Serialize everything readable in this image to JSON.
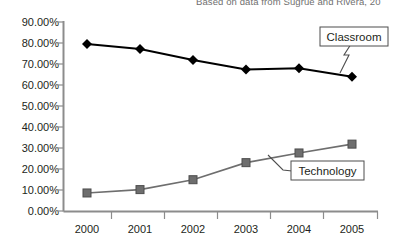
{
  "source_note": "Based on data from Sugrue and Rivera, 20",
  "chart_data": {
    "type": "line",
    "title": "",
    "subtitle": "",
    "xlabel": "",
    "ylabel": "",
    "categories": [
      "2000",
      "2001",
      "2002",
      "2003",
      "2004",
      "2005"
    ],
    "ytick_labels": [
      "0.00%",
      "10.00%",
      "20.00%",
      "30.00%",
      "40.00%",
      "50.00%",
      "60.00%",
      "70.00%",
      "80.00%",
      "90.00%"
    ],
    "ytick_values": [
      0,
      10,
      20,
      30,
      40,
      50,
      60,
      70,
      80,
      90
    ],
    "ylim": [
      0,
      90
    ],
    "grid": false,
    "legend_position": "inline-callouts",
    "series": [
      {
        "name": "Classroom",
        "values": [
          79.5,
          77.2,
          72.0,
          67.4,
          68.0,
          64.0
        ],
        "color": "#000000",
        "marker": "diamond"
      },
      {
        "name": "Technology",
        "values": [
          8.8,
          10.4,
          15.1,
          23.2,
          27.8,
          32.0
        ],
        "color": "#6e6e6e",
        "marker": "square"
      }
    ],
    "annotations": [
      {
        "label": "Classroom",
        "series": "Classroom"
      },
      {
        "label": "Technology",
        "series": "Technology"
      }
    ]
  }
}
